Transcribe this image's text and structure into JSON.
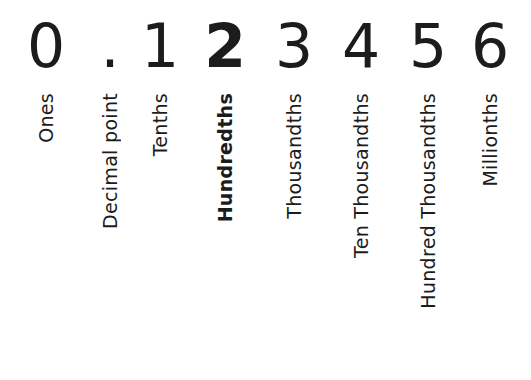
{
  "number": "0.123456",
  "columns": [
    {
      "digit": "0",
      "label": "Ones",
      "center_x": 46,
      "bold": false
    },
    {
      "digit": ".",
      "label": "Decimal point",
      "center_x": 110,
      "bold": false
    },
    {
      "digit": "1",
      "label": "Tenths",
      "center_x": 160,
      "bold": false
    },
    {
      "digit": "2",
      "label": "Hundredths",
      "center_x": 225,
      "bold": true
    },
    {
      "digit": "3",
      "label": "Thousandths",
      "center_x": 294,
      "bold": false
    },
    {
      "digit": "4",
      "label": "Ten Thousandths",
      "center_x": 361,
      "bold": false
    },
    {
      "digit": "5",
      "label": "Hundred Thousandths",
      "center_x": 428,
      "bold": false
    },
    {
      "digit": "6",
      "label": "Millionths",
      "center_x": 490,
      "bold": false
    }
  ],
  "highlighted_place": "Hundredths",
  "colors": {
    "text": "#1c1c1c",
    "background": "#ffffff"
  }
}
